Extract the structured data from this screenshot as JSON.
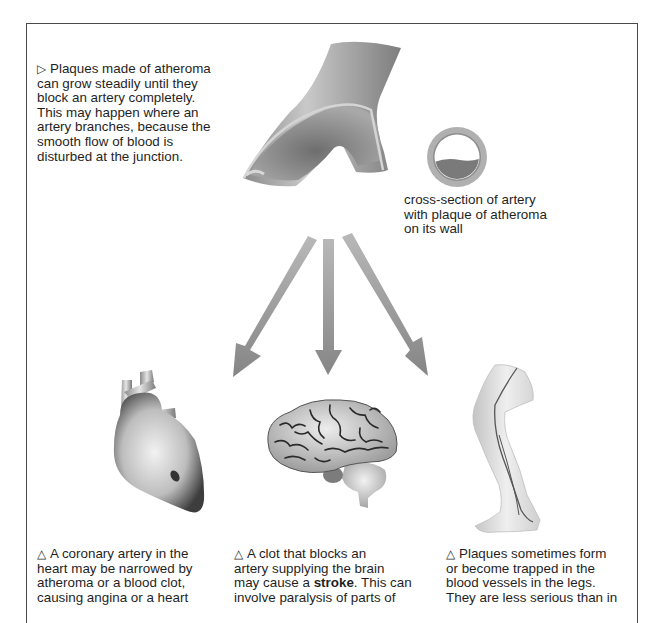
{
  "diagram": {
    "intro": {
      "marker": "▷",
      "lines": [
        "Plaques made of atheroma",
        "can grow steadily until they",
        "block an artery completely.",
        "This may happen where an",
        "artery branches, because the",
        "smooth flow of blood is",
        "disturbed at the junction."
      ]
    },
    "cross_section_label": {
      "lines": [
        "cross-section of artery",
        "with plaque of atheroma",
        "on its wall"
      ]
    },
    "illustrations": {
      "artery": "branching-artery-illustration",
      "cross_section": "artery-cross-section-illustration",
      "heart": "heart-illustration",
      "brain": "brain-illustration",
      "leg": "leg-illustration"
    },
    "arrows": [
      "arrow-to-heart",
      "arrow-to-brain",
      "arrow-to-leg"
    ],
    "colors": {
      "border": "#4a4a4a",
      "arrow": "#8c8c8c",
      "artery": "#9a9a9a",
      "plaque": "#7a7a7a",
      "text": "#1f1f1f"
    },
    "captions": [
      {
        "marker": "△",
        "lines": [
          "A coronary artery in the",
          "heart may be narrowed by",
          "atheroma or a blood clot,",
          "causing angina or a heart"
        ]
      },
      {
        "marker": "△",
        "lines": [
          "A clot that blocks an",
          "artery supplying the brain",
          "may cause a ",
          "stroke",
          ". This can",
          "involve paralysis of parts of"
        ]
      },
      {
        "marker": "△",
        "lines": [
          "Plaques sometimes form",
          "or become trapped in the",
          "blood vessels in the legs.",
          "They are less serious than in"
        ]
      }
    ]
  }
}
